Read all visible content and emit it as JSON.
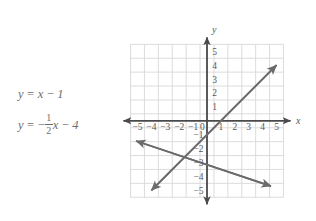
{
  "figure": {
    "title": "",
    "equations": [
      {
        "id": "line-1",
        "lhs": "y",
        "eq": "=",
        "rhs_text": "x − 1",
        "slope": 1,
        "intercept": -1,
        "parts": {
          "var": "x",
          "op": "−",
          "constant": "1"
        }
      },
      {
        "id": "line-2",
        "lhs": "y",
        "eq": "=",
        "rhs_text": "− 1/2 x − 4",
        "slope": -0.5,
        "intercept": -4,
        "parts": {
          "lead_minus": "−",
          "numerator": "1",
          "denominator": "2",
          "var": "x",
          "op": "−",
          "constant": "4"
        }
      }
    ]
  },
  "chart_data": {
    "type": "line",
    "title": "",
    "xlabel": "x",
    "ylabel": "y",
    "xlim": [
      -5.5,
      5.5
    ],
    "ylim": [
      -5.5,
      5.5
    ],
    "grid": true,
    "legend": "none",
    "xticks": [
      -5,
      -4,
      -3,
      -2,
      -1,
      0,
      1,
      2,
      3,
      4,
      5
    ],
    "xtick_labels": [
      "−5",
      "−4",
      "−3",
      "−2",
      "−1",
      "0",
      "1",
      "2",
      "3",
      "4",
      "5"
    ],
    "yticks": [
      -5,
      -4,
      -3,
      -2,
      -1,
      1,
      2,
      3,
      4,
      5
    ],
    "ytick_labels": [
      "−5",
      "−4",
      "−3",
      "−2",
      "−1",
      "1",
      "2",
      "3",
      "4",
      "5"
    ],
    "origin_label": "0",
    "series": [
      {
        "name": "y = x - 1",
        "slope": 1,
        "intercept": -1,
        "color": "#6b6b6d",
        "arrows": "both",
        "x_start": -4.0,
        "y_start": -5.0,
        "x_end": 5.0,
        "y_end": 4.0
      },
      {
        "name": "y = -1/2x - 4",
        "slope": -0.5,
        "intercept": -4,
        "color": "#6b6b6d",
        "arrows": "both",
        "x_start": -5.1,
        "y_start": -1.45,
        "x_end": 4.6,
        "y_end": -4.7
      }
    ],
    "intersection": {
      "x": -2,
      "y": -3
    },
    "axis_color": "#4a4a4c",
    "grid_color": "#d8d8da",
    "line_color": "#6b6b6d"
  }
}
